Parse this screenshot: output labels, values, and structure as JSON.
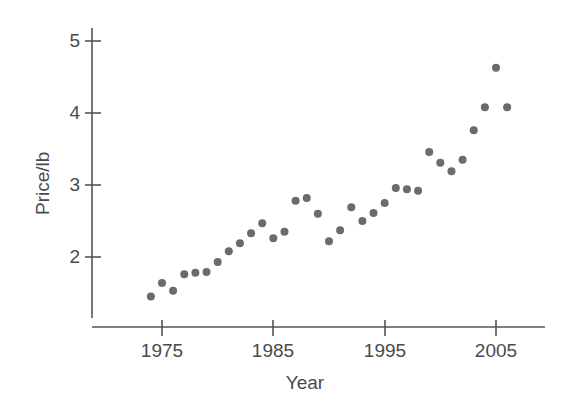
{
  "chart_data": {
    "type": "scatter",
    "title": "",
    "xlabel": "Year",
    "ylabel": "Price/lb",
    "xlim": [
      1972.0,
      2007.5
    ],
    "ylim": [
      1.25,
      5.15
    ],
    "xticks": [
      1975,
      1985,
      1995,
      2005
    ],
    "xtick_labels": [
      "1975",
      "1985",
      "1995",
      "2005"
    ],
    "yticks": [
      2,
      3,
      4,
      5
    ],
    "ytick_labels": [
      "2",
      "3",
      "4",
      "5"
    ],
    "grid": false,
    "legend": null,
    "marker": {
      "shape": "circle",
      "color": "#6b6b6b",
      "size_px": 8
    },
    "axis_color": "#555555",
    "x": [
      1974,
      1975,
      1976,
      1977,
      1978,
      1979,
      1980,
      1981,
      1982,
      1983,
      1984,
      1985,
      1986,
      1987,
      1988,
      1989,
      1990,
      1991,
      1992,
      1993,
      1994,
      1995,
      1996,
      1997,
      1998,
      1999,
      2000,
      2001,
      2002,
      2003,
      2004,
      2005,
      2006
    ],
    "y": [
      1.45,
      1.64,
      1.53,
      1.76,
      1.78,
      1.79,
      1.93,
      2.08,
      2.19,
      2.33,
      2.47,
      2.26,
      2.35,
      2.78,
      2.82,
      2.6,
      2.22,
      2.37,
      2.69,
      2.5,
      2.61,
      2.75,
      2.96,
      2.94,
      2.92,
      3.46,
      3.31,
      3.19,
      3.35,
      3.76,
      4.08,
      4.63,
      4.08
    ],
    "points": [
      {
        "year": 1974,
        "price": 1.45
      },
      {
        "year": 1975,
        "price": 1.64
      },
      {
        "year": 1976,
        "price": 1.53
      },
      {
        "year": 1977,
        "price": 1.76
      },
      {
        "year": 1978,
        "price": 1.78
      },
      {
        "year": 1979,
        "price": 1.79
      },
      {
        "year": 1980,
        "price": 1.93
      },
      {
        "year": 1981,
        "price": 2.08
      },
      {
        "year": 1982,
        "price": 2.19
      },
      {
        "year": 1983,
        "price": 2.33
      },
      {
        "year": 1984,
        "price": 2.47
      },
      {
        "year": 1985,
        "price": 2.26
      },
      {
        "year": 1986,
        "price": 2.35
      },
      {
        "year": 1987,
        "price": 2.78
      },
      {
        "year": 1988,
        "price": 2.82
      },
      {
        "year": 1989,
        "price": 2.6
      },
      {
        "year": 1990,
        "price": 2.22
      },
      {
        "year": 1991,
        "price": 2.37
      },
      {
        "year": 1992,
        "price": 2.69
      },
      {
        "year": 1993,
        "price": 2.5
      },
      {
        "year": 1994,
        "price": 2.61
      },
      {
        "year": 1995,
        "price": 2.75
      },
      {
        "year": 1996,
        "price": 2.96
      },
      {
        "year": 1997,
        "price": 2.94
      },
      {
        "year": 1998,
        "price": 2.92
      },
      {
        "year": 1999,
        "price": 3.46
      },
      {
        "year": 2000,
        "price": 3.31
      },
      {
        "year": 2001,
        "price": 3.19
      },
      {
        "year": 2002,
        "price": 3.35
      },
      {
        "year": 2003,
        "price": 3.76
      },
      {
        "year": 2004,
        "price": 4.08
      },
      {
        "year": 2005,
        "price": 4.63
      },
      {
        "year": 2006,
        "price": 4.08
      }
    ]
  },
  "axes": {
    "x_label": "Year",
    "y_label": "Price/lb",
    "x_tick_labels": [
      "1975",
      "1985",
      "1995",
      "2005"
    ],
    "y_tick_labels": [
      "5",
      "4",
      "3",
      "2"
    ]
  }
}
